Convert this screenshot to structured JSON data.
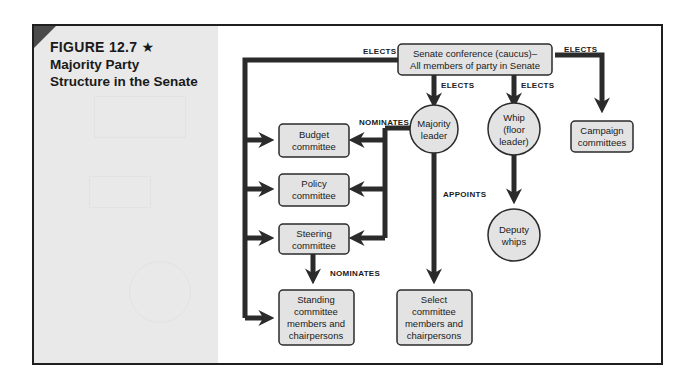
{
  "figure": {
    "number": "FIGURE 12.7 ★",
    "title_lines": [
      "Majority Party",
      "Structure in the Senate"
    ]
  },
  "colors": {
    "line": "#2b2b2b",
    "node_fill": "#e3e3e3",
    "panel": "#e9e9e9",
    "corner": "#4a4a4a"
  },
  "nodes": {
    "conference": [
      "Senate conference (caucus)–",
      "All members of party in Senate"
    ],
    "majority_leader": [
      "Majority",
      "leader"
    ],
    "whip": [
      "Whip",
      "(floor",
      "leader)"
    ],
    "campaign": [
      "Campaign",
      "committees"
    ],
    "budget": [
      "Budget",
      "committee"
    ],
    "policy": [
      "Policy",
      "committee"
    ],
    "steering": [
      "Steering",
      "committee"
    ],
    "deputy_whips": [
      "Deputy",
      "whips"
    ],
    "standing": [
      "Standing",
      "committee",
      "members and",
      "chairpersons"
    ],
    "select": [
      "Select",
      "committee",
      "members and",
      "chairpersons"
    ]
  },
  "edge_labels": {
    "elects_left": "ELECTS",
    "elects_leader": "ELECTS",
    "elects_whip": "ELECTS",
    "elects_campaign": "ELECTS",
    "nominates_leader": "NOMINATES",
    "nominates_steering": "NOMINATES",
    "appoints": "APPOINTS"
  }
}
